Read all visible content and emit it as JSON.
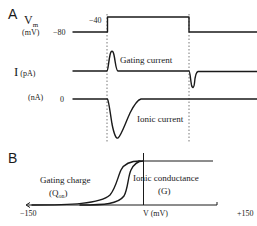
{
  "panel_a": {
    "label": "A",
    "vm_label": "V",
    "vm_sub": "m",
    "vm_unit": "(mV)",
    "holding_label": "−80",
    "step_label": "−40",
    "current_label": "I",
    "current_unit_pa": "(pA)",
    "current_unit_na": "(nA)",
    "zero_label": "0",
    "gating_current_label": "Gating current",
    "ionic_current_label": "Ionic current"
  },
  "panel_b": {
    "label": "B",
    "x_min_label": "−150",
    "x_axis_label": "V (mV)",
    "x_max_label": "+150",
    "gating_charge_label": "Gating charge",
    "gating_charge_symbol": "(Q",
    "gating_charge_sub": "on",
    "gating_charge_close": ")",
    "ionic_conductance_label": "Ionic conductance",
    "ionic_conductance_symbol": "(G)"
  },
  "colors": {
    "ink": "#1a1a1a",
    "dashed": "#555555",
    "background": "#ffffff"
  }
}
